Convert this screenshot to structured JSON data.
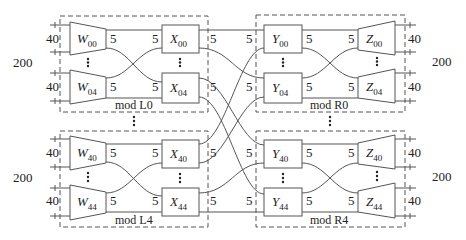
{
  "diagram": {
    "left_modules": [
      {
        "label": "mod L0",
        "top_node": {
          "letter": "W",
          "sub": "00"
        },
        "bot_node": {
          "letter": "W",
          "sub": "04"
        },
        "top_x": {
          "letter": "X",
          "sub": "00"
        },
        "bot_x": {
          "letter": "X",
          "sub": "04"
        }
      },
      {
        "label": "mod L4",
        "top_node": {
          "letter": "W",
          "sub": "40"
        },
        "bot_node": {
          "letter": "W",
          "sub": "44"
        },
        "top_x": {
          "letter": "X",
          "sub": "40"
        },
        "bot_x": {
          "letter": "X",
          "sub": "44"
        }
      }
    ],
    "right_modules": [
      {
        "label": "mod R0",
        "top_y": {
          "letter": "Y",
          "sub": "00"
        },
        "bot_y": {
          "letter": "Y",
          "sub": "04"
        },
        "top_node": {
          "letter": "Z",
          "sub": "00"
        },
        "bot_node": {
          "letter": "Z",
          "sub": "04"
        }
      },
      {
        "label": "mod R4",
        "top_y": {
          "letter": "Y",
          "sub": "40"
        },
        "bot_y": {
          "letter": "Y",
          "sub": "44"
        },
        "top_node": {
          "letter": "Z",
          "sub": "40"
        },
        "bot_node": {
          "letter": "Z",
          "sub": "44"
        }
      }
    ],
    "labels": {
      "group_total": "200",
      "port_width": "40",
      "link_width": "5"
    }
  }
}
